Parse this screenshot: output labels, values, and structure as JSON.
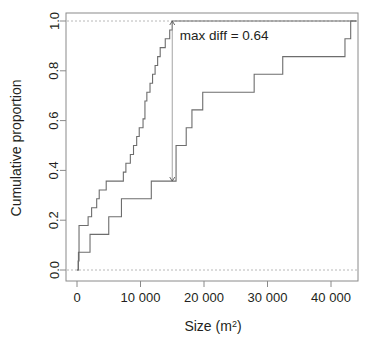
{
  "chart_data": {
    "type": "line",
    "subtype": "ecdf-step",
    "title": "",
    "xlabel": "Size (m2)",
    "xlabel_base": "Size (m",
    "xlabel_sup": "2",
    "xlabel_close": ")",
    "ylabel": "Cumulative proportion",
    "xlim": [
      -1800,
      44500
    ],
    "ylim": [
      -0.04,
      1.04
    ],
    "xticks": [
      0,
      10000,
      20000,
      30000,
      40000
    ],
    "xticklabels": [
      "0",
      "10 000",
      "20 000",
      "30 000",
      "40 000"
    ],
    "yticks": [
      0.0,
      0.2,
      0.4,
      0.6,
      0.8,
      1.0
    ],
    "yticklabels": [
      "0.0",
      "0.2",
      "0.4",
      "0.6",
      "0.8",
      "1.0"
    ],
    "grid": "horizontal-dashed-at-0-and-1",
    "legend": "none",
    "annotations": [
      {
        "name": "max-diff-label",
        "text": "max diff = 0.64",
        "x": 16200,
        "y": 0.925
      },
      {
        "name": "max-diff-arrow",
        "x": 15000,
        "y_from": 0.357,
        "y_to": 1.0,
        "double_headed": true
      }
    ],
    "series": [
      {
        "name": "left-curve",
        "label": "Upper ECDF",
        "color": "#6d6d6d",
        "points": [
          [
            0,
            0.0
          ],
          [
            180,
            0.036
          ],
          [
            320,
            0.179
          ],
          [
            1750,
            0.214
          ],
          [
            2300,
            0.25
          ],
          [
            3100,
            0.286
          ],
          [
            3500,
            0.321
          ],
          [
            4600,
            0.357
          ],
          [
            7300,
            0.393
          ],
          [
            7700,
            0.429
          ],
          [
            8400,
            0.464
          ],
          [
            8900,
            0.5
          ],
          [
            9400,
            0.536
          ],
          [
            9800,
            0.571
          ],
          [
            10400,
            0.607
          ],
          [
            10700,
            0.679
          ],
          [
            11000,
            0.714
          ],
          [
            11500,
            0.75
          ],
          [
            11900,
            0.786
          ],
          [
            12300,
            0.821
          ],
          [
            12700,
            0.857
          ],
          [
            13100,
            0.893
          ],
          [
            13900,
            0.929
          ],
          [
            14600,
            0.964
          ],
          [
            15000,
            1.0
          ],
          [
            44000,
            1.0
          ]
        ]
      },
      {
        "name": "right-curve",
        "label": "Lower ECDF",
        "color": "#6d6d6d",
        "points": [
          [
            0,
            0.0
          ],
          [
            230,
            0.071
          ],
          [
            2050,
            0.143
          ],
          [
            5000,
            0.214
          ],
          [
            7000,
            0.286
          ],
          [
            11700,
            0.357
          ],
          [
            15000,
            0.357
          ],
          [
            15600,
            0.5
          ],
          [
            17200,
            0.571
          ],
          [
            18100,
            0.643
          ],
          [
            19800,
            0.714
          ],
          [
            27900,
            0.786
          ],
          [
            32400,
            0.857
          ],
          [
            42200,
            0.929
          ],
          [
            43100,
            1.0
          ],
          [
            44000,
            1.0
          ]
        ]
      }
    ]
  },
  "axes": {
    "y_title": "Cumulative proportion"
  }
}
